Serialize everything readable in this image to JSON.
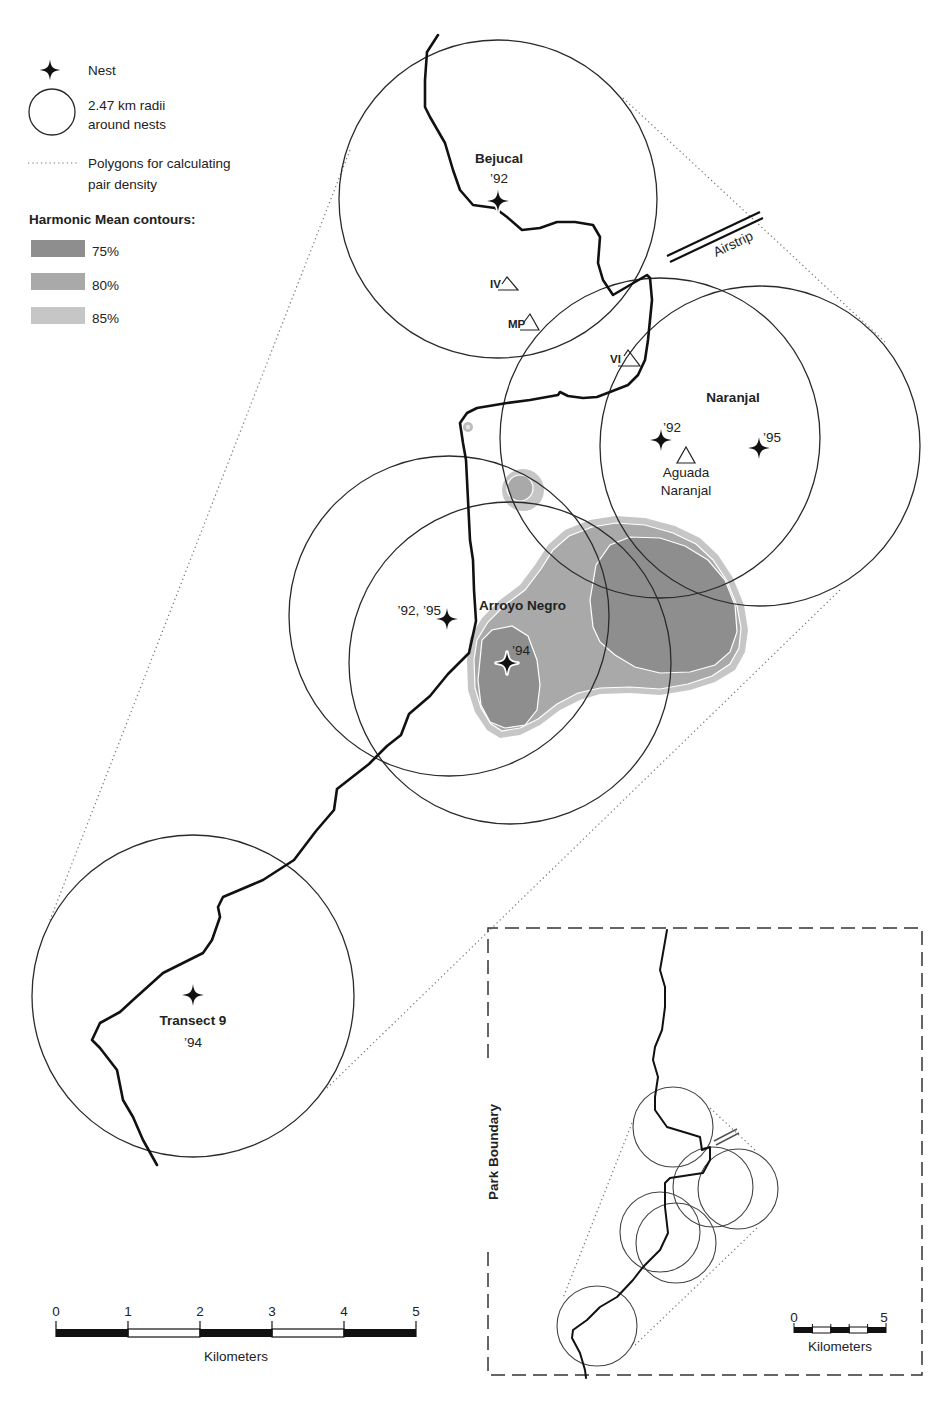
{
  "legend": {
    "nest_label": "Nest",
    "radius_label_line1": "2.47 km radii",
    "radius_label_line2": "around nests",
    "polygon_label_line1": "Polygons for calculating",
    "polygon_label_line2": "pair density",
    "contours_title": "Harmonic Mean contours:",
    "contours": [
      {
        "label": "75%",
        "color": "#8e8e8e"
      },
      {
        "label": "80%",
        "color": "#a9a9a9"
      },
      {
        "label": "85%",
        "color": "#c6c6c6"
      }
    ]
  },
  "sites": {
    "bejucal": {
      "name": "Bejucal",
      "years": "’92"
    },
    "naranjal": {
      "name": "Naranjal",
      "nest_1_year": "’92",
      "nest_2_year": "’95",
      "waterhole_line1": "Aguada",
      "waterhole_line2": "Naranjal"
    },
    "arroyo_negro": {
      "name": "Arroyo Negro",
      "nest_1_year": "’92, ’95",
      "nest_2_year": "’94"
    },
    "transect_9": {
      "name": "Transect 9",
      "years": "’94"
    }
  },
  "landmarks": {
    "airstrip": "Airstrip",
    "markers": [
      {
        "label": "IV"
      },
      {
        "label": "MP"
      },
      {
        "label": "VI"
      }
    ]
  },
  "scale_bar": {
    "ticks": [
      "0",
      "1",
      "2",
      "3",
      "4",
      "5"
    ],
    "unit": "Kilometers"
  },
  "inset": {
    "title": "Park Boundary",
    "scale_bar": {
      "ticks": [
        "0",
        "5"
      ],
      "unit": "Kilometers"
    }
  }
}
